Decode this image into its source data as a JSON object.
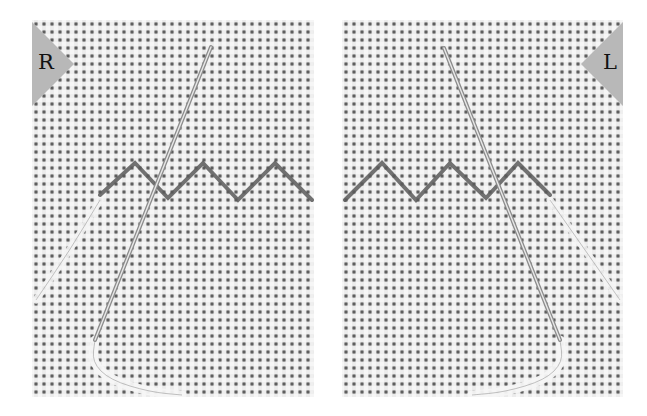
{
  "panels": [
    {
      "id": "left",
      "badge_label": "R",
      "badge_side": "left",
      "zigzag_points": [
        [
          100,
          195
        ],
        [
          135,
          163
        ],
        [
          168,
          198
        ],
        [
          203,
          163
        ],
        [
          238,
          200
        ],
        [
          275,
          163
        ],
        [
          312,
          200
        ]
      ],
      "needle": {
        "tip": [
          211,
          47
        ],
        "eye": [
          95,
          340
        ]
      },
      "thread_loop": [
        [
          95,
          340
        ],
        [
          92,
          362
        ],
        [
          110,
          380
        ],
        [
          150,
          392
        ],
        [
          182,
          395
        ]
      ],
      "tail_thread": [
        [
          100,
          200
        ],
        [
          70,
          250
        ],
        [
          36,
          300
        ]
      ]
    },
    {
      "id": "right",
      "badge_label": "L",
      "badge_side": "right",
      "zigzag_points": [
        [
          345,
          200
        ],
        [
          382,
          163
        ],
        [
          416,
          200
        ],
        [
          450,
          163
        ],
        [
          486,
          198
        ],
        [
          518,
          163
        ],
        [
          550,
          195
        ]
      ],
      "needle": {
        "tip": [
          444,
          48
        ],
        "eye": [
          560,
          340
        ]
      },
      "thread_loop": [
        [
          560,
          340
        ],
        [
          563,
          362
        ],
        [
          545,
          380
        ],
        [
          505,
          392
        ],
        [
          472,
          395
        ]
      ],
      "tail_thread": [
        [
          550,
          200
        ],
        [
          585,
          250
        ],
        [
          620,
          300
        ]
      ]
    }
  ],
  "colors": {
    "background": "#ffffff",
    "fabric": "#dcdcdc",
    "fabric_holes": "#4a4a4a",
    "badge": "#b8b8b8",
    "badge_text": "#111111",
    "stitch": "#5a5a5a",
    "needle": "#8c8c8c",
    "needle_highlight": "#e8e8e8",
    "thread_light": "#f2f2f2"
  }
}
